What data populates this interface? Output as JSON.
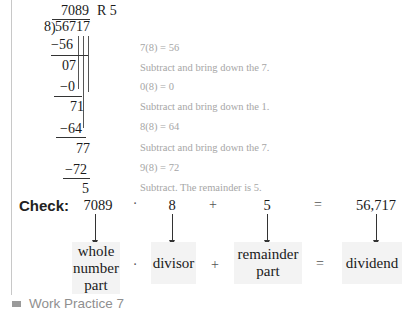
{
  "division": {
    "quotient": "7089",
    "remainder_label": "R 5",
    "divisor": "8",
    "dividend": "56717",
    "rows": [
      {
        "value": "−56",
        "kind": "subtract",
        "note": "7(8)  =  56"
      },
      {
        "value": "07",
        "kind": "result",
        "note": "Subtract and bring down the 7."
      },
      {
        "value": "−0",
        "kind": "subtract",
        "note": "0(8)  =  0"
      },
      {
        "value": "71",
        "kind": "result",
        "note": "Subtract and bring down the 1."
      },
      {
        "value": "−64",
        "kind": "subtract",
        "note": "8(8)  =  64"
      },
      {
        "value": "77",
        "kind": "result",
        "note": "Subtract and bring down the 7."
      },
      {
        "value": "−72",
        "kind": "subtract",
        "note": "9(8)  =  72"
      },
      {
        "value": "5",
        "kind": "result",
        "note": "Subtract. The remainder is 5."
      }
    ]
  },
  "check": {
    "label": "Check:",
    "values": [
      "7089",
      "8",
      "5",
      "56,717"
    ],
    "operators": [
      "·",
      "+",
      "="
    ],
    "boxes": [
      {
        "line1": "whole",
        "line2": "number",
        "line3": "part"
      },
      {
        "line1": "divisor"
      },
      {
        "line1": "remainder",
        "line2": "part"
      },
      {
        "line1": "dividend"
      }
    ]
  },
  "footer": {
    "label": "Work Practice 7"
  }
}
